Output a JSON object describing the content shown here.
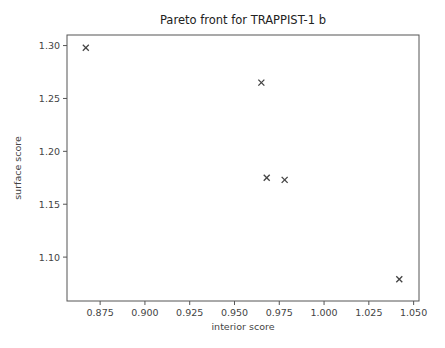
{
  "chart_data": {
    "type": "scatter",
    "title": "Pareto front for TRAPPIST-1 b",
    "xlabel": "interior score",
    "ylabel": "surface score",
    "marker": "x",
    "grid": false,
    "legend": null,
    "xlim": [
      0.8565,
      1.053
    ],
    "ylim": [
      1.0585,
      1.31
    ],
    "xticks": [
      0.875,
      0.9,
      0.925,
      0.95,
      0.975,
      1.0,
      1.025,
      1.05
    ],
    "xtick_labels": [
      "0.875",
      "0.900",
      "0.925",
      "0.950",
      "0.975",
      "1.000",
      "1.025",
      "1.050"
    ],
    "yticks": [
      1.1,
      1.15,
      1.2,
      1.25,
      1.3
    ],
    "ytick_labels": [
      "1.10",
      "1.15",
      "1.20",
      "1.25",
      "1.30"
    ],
    "points": [
      {
        "x": 0.867,
        "y": 1.298
      },
      {
        "x": 0.965,
        "y": 1.265
      },
      {
        "x": 0.968,
        "y": 1.175
      },
      {
        "x": 0.978,
        "y": 1.173
      },
      {
        "x": 1.042,
        "y": 1.079
      }
    ]
  },
  "style": {
    "marker_color": "#444444",
    "axis_color": "#555555"
  }
}
